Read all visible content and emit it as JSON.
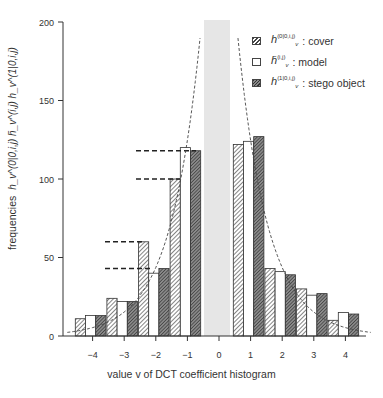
{
  "chart_data": {
    "type": "bar",
    "title": "",
    "xlabel": "value v of DCT coefficient histogram",
    "ylabel": "frequencies",
    "ylabel_symbols": [
      "h_v^(0|0,i,j)",
      "h̄_v^(i,j)",
      "h_v^(1|0,i,j)"
    ],
    "ylim": [
      0,
      200
    ],
    "yticks": [
      0,
      50,
      100,
      150,
      200
    ],
    "categories": [
      -4,
      -3,
      -2,
      -1,
      0,
      1,
      2,
      3,
      4
    ],
    "series": [
      {
        "name": "cover",
        "symbol": "h_v^(0|0,i,j)",
        "pattern": "hatched",
        "values": [
          11,
          24,
          60,
          100,
          null,
          122,
          43,
          30,
          10
        ]
      },
      {
        "name": "model",
        "symbol": "h̄_v^(i,j)",
        "pattern": "white",
        "values": [
          13,
          22,
          40,
          120,
          null,
          124,
          41,
          26,
          15
        ]
      },
      {
        "name": "stego object",
        "symbol": "h_v^(1|0,i,j)",
        "pattern": "dark-hatched",
        "values": [
          13,
          22,
          43,
          118,
          null,
          127,
          39,
          27,
          14
        ]
      }
    ],
    "excluded_category": 0,
    "annotations": {
      "dashed_reference_lines": [
        118,
        100,
        60,
        43
      ],
      "fitted_curve": "dashed model density curve",
      "excluded_band": "gray shaded band at v = 0"
    },
    "grid": false,
    "legend_position": "upper right"
  },
  "legend": {
    "items": [
      {
        "symbol": "h",
        "sup": "(0|0,i,j)",
        "sub": "v",
        "label": ": cover"
      },
      {
        "symbol": "h̄",
        "sup": "(i,j)",
        "sub": "v",
        "label": ": model"
      },
      {
        "symbol": "h",
        "sup": "(1|0,i,j)",
        "sub": "v",
        "label": ": stego object"
      }
    ]
  },
  "axis": {
    "ylabel_text": "frequencies",
    "ylabel_symbols": "h_v^(0|0,i,j)  h̄_v^(i,j)  h_v^(1|0,i,j)",
    "xlabel": "value v of DCT coefficient histogram"
  }
}
